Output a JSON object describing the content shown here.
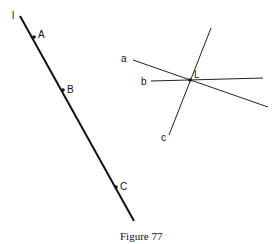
{
  "figure": {
    "caption": "Figure 77",
    "line_l": {
      "label": "l",
      "points": [
        {
          "label": "A"
        },
        {
          "label": "B"
        },
        {
          "label": "C"
        }
      ]
    },
    "pencil": {
      "intersection_label": "L",
      "lines": [
        {
          "label": "a"
        },
        {
          "label": "b"
        },
        {
          "label": "c"
        }
      ]
    }
  }
}
